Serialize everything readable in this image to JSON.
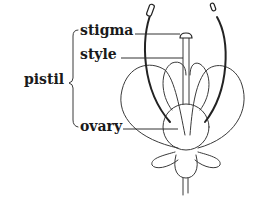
{
  "diagram": {
    "type": "labeled-botanical-illustration",
    "group_label": "pistil",
    "labels": [
      {
        "id": "stigma",
        "text": "stigma"
      },
      {
        "id": "style",
        "text": "style"
      },
      {
        "id": "ovary",
        "text": "ovary"
      }
    ],
    "colors": {
      "ink": "#1a1a1a",
      "line": "#333333",
      "background": "#ffffff"
    }
  }
}
